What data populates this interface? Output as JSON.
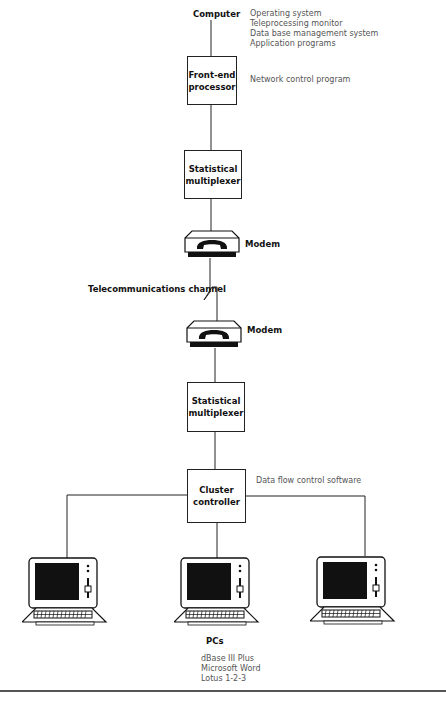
{
  "diagram": {
    "computer": {
      "label": "Computer",
      "software": [
        "Operating system",
        "Teleprocessing monitor",
        "Data base management system",
        "Application programs"
      ]
    },
    "front_end": {
      "line1": "Front-end",
      "line2": "processor",
      "note": "Network control program"
    },
    "mux_top": {
      "line1": "Statistical",
      "line2": "multiplexer"
    },
    "modem_top": {
      "label": "Modem",
      "icon": "telephone-modem-icon"
    },
    "channel": {
      "label": "Telecommunications channel"
    },
    "modem_bottom": {
      "label": "Modem",
      "icon": "telephone-modem-icon"
    },
    "mux_bottom": {
      "line1": "Statistical",
      "line2": "multiplexer"
    },
    "cluster": {
      "line1": "Cluster",
      "line2": "controller",
      "note": "Data flow control software"
    },
    "pcs": {
      "label": "PCs",
      "count": 3,
      "icon": "personal-computer-icon",
      "software": [
        "dBase III Plus",
        "Microsoft Word",
        "Lotus 1-2-3"
      ]
    },
    "colors": {
      "line": "#222222",
      "note_text": "#555555",
      "label_text": "#111111"
    }
  }
}
